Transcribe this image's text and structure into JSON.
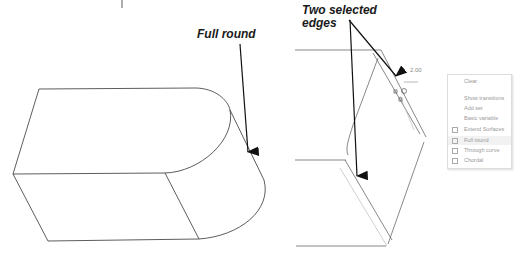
{
  "left_figure": {
    "callout": "Full round"
  },
  "right_figure": {
    "callout_line1": "Two selected",
    "callout_line2": "edges",
    "dimension": "2.00"
  },
  "context_menu": {
    "items": [
      {
        "label": "Clear",
        "checkbox": false
      },
      {
        "label": "",
        "checkbox": false
      },
      {
        "label": "Show transitions",
        "checkbox": false
      },
      {
        "label": "Add set",
        "checkbox": false
      },
      {
        "label": "Basic variable",
        "checkbox": false
      },
      {
        "label": "Extend Surfaces",
        "checkbox": true
      },
      {
        "label": "Full round",
        "checkbox": true,
        "highlighted": true
      },
      {
        "label": "Through curve",
        "checkbox": true
      },
      {
        "label": "Chordal",
        "checkbox": true
      }
    ]
  }
}
